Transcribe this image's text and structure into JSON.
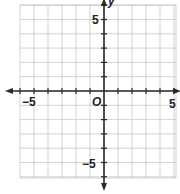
{
  "diagram": {
    "type": "coordinate-plane",
    "x_range": [
      -6,
      5
    ],
    "y_range": [
      -6,
      6
    ],
    "grid_step": 1,
    "origin_label": "O",
    "x_axis_label": "",
    "y_axis_label": "y",
    "tick_labels": {
      "x_neg": "−5",
      "x_pos": "5",
      "y_pos": "5",
      "y_neg": "−5"
    },
    "colors": {
      "grid": "#c8c8c8",
      "axis": "#2a2a2a",
      "background": "#ffffff"
    }
  }
}
